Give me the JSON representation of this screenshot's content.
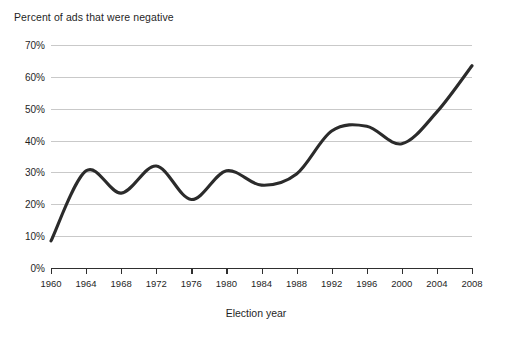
{
  "chart_data": {
    "type": "line",
    "title": "Percent of ads that were negative",
    "xlabel": "Election year",
    "ylabel": "",
    "xlim": [
      1960,
      2008
    ],
    "ylim": [
      0,
      70
    ],
    "grid": true,
    "legend": "none",
    "x": [
      1960,
      1964,
      1968,
      1972,
      1976,
      1980,
      1984,
      1988,
      1992,
      1996,
      2000,
      2004,
      2008
    ],
    "xticklabels": [
      "1960",
      "1964",
      "1968",
      "1972",
      "1976",
      "1980",
      "1984",
      "1988",
      "1992",
      "1996",
      "2000",
      "2004",
      "2008"
    ],
    "yticks": [
      0,
      10,
      20,
      30,
      40,
      50,
      60,
      70
    ],
    "yticklabels": [
      "0%",
      "10%",
      "20%",
      "30%",
      "40%",
      "50%",
      "60%",
      "70%"
    ],
    "series": [
      {
        "name": "Percent of ads that were negative",
        "color": "#2b2b2b",
        "values": [
          8.5,
          30.5,
          23.5,
          32,
          21.5,
          30.5,
          26,
          29.5,
          43,
          44.5,
          39,
          49,
          63.5
        ]
      }
    ],
    "colors": {
      "line": "#2b2b2b",
      "grid": "#c9c9c9",
      "axis": "#2f2f2f",
      "text": "#1f1f1f",
      "background": "#ffffff"
    }
  }
}
